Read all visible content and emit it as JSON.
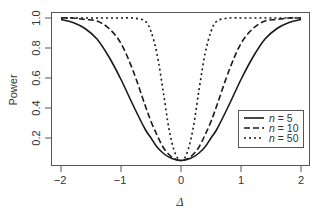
{
  "chart_data": {
    "type": "line",
    "title": "",
    "xlabel": "Δ",
    "ylabel": "Power",
    "xlim": [
      -2,
      2
    ],
    "ylim": [
      0.02,
      1.0
    ],
    "x_ticks": [
      -2,
      -1,
      0,
      1,
      2
    ],
    "x_tick_labels": [
      "−2",
      "−1",
      "0",
      "1",
      "2"
    ],
    "y_ticks": [
      0.2,
      0.4,
      0.6,
      0.8,
      1.0
    ],
    "y_tick_labels": [
      "0.2",
      "0.4",
      "0.6",
      "0.8",
      "1.0"
    ],
    "grid": false,
    "legend_position": "bottom-right",
    "x": [
      -2.0,
      -1.8,
      -1.6,
      -1.4,
      -1.2,
      -1.0,
      -0.8,
      -0.6,
      -0.5,
      -0.4,
      -0.3,
      -0.2,
      -0.1,
      0.0,
      0.1,
      0.2,
      0.3,
      0.4,
      0.5,
      0.6,
      0.8,
      1.0,
      1.2,
      1.4,
      1.6,
      1.8,
      2.0
    ],
    "series": [
      {
        "name": "n = 5",
        "style": "solid",
        "values": [
          0.99,
          0.97,
          0.93,
          0.86,
          0.74,
          0.59,
          0.42,
          0.26,
          0.2,
          0.14,
          0.1,
          0.073,
          0.056,
          0.05,
          0.056,
          0.073,
          0.1,
          0.14,
          0.2,
          0.26,
          0.42,
          0.59,
          0.74,
          0.86,
          0.93,
          0.97,
          0.99
        ]
      },
      {
        "name": "n = 10",
        "style": "dashed",
        "values": [
          1.0,
          1.0,
          0.99,
          0.98,
          0.93,
          0.83,
          0.65,
          0.42,
          0.31,
          0.22,
          0.14,
          0.09,
          0.06,
          0.05,
          0.06,
          0.09,
          0.14,
          0.22,
          0.31,
          0.42,
          0.65,
          0.83,
          0.93,
          0.98,
          0.99,
          1.0,
          1.0
        ]
      },
      {
        "name": "n = 50",
        "style": "dotted",
        "values": [
          1.0,
          1.0,
          1.0,
          1.0,
          1.0,
          1.0,
          1.0,
          0.98,
          0.91,
          0.76,
          0.52,
          0.26,
          0.1,
          0.05,
          0.1,
          0.26,
          0.52,
          0.76,
          0.91,
          0.98,
          1.0,
          1.0,
          1.0,
          1.0,
          1.0,
          1.0,
          1.0
        ]
      }
    ]
  },
  "legend": {
    "items": [
      {
        "var": "n",
        "eq": " = 5"
      },
      {
        "var": "n",
        "eq": " = 10"
      },
      {
        "var": "n",
        "eq": " = 50"
      }
    ]
  },
  "axes": {
    "ylabel": "Power",
    "xlabel": "Δ",
    "x_tick_labels": [
      "−2",
      "−1",
      "0",
      "1",
      "2"
    ],
    "y_tick_labels": [
      "0.2",
      "0.4",
      "0.6",
      "0.8",
      "1.0"
    ]
  }
}
